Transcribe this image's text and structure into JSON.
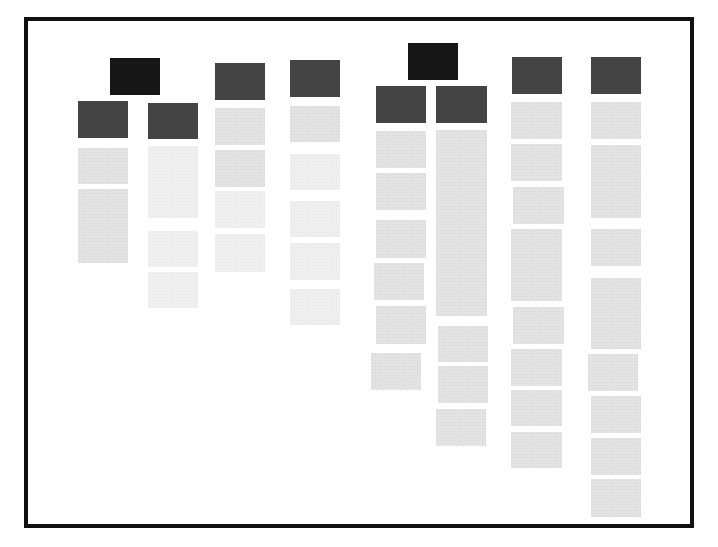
{
  "diagram": {
    "title": "",
    "type": "block-tree-wireframe",
    "colors": {
      "background": "#ffffff",
      "frame_border": "#111111",
      "root": "#1a1a1a",
      "header": "#4d4d4d",
      "item": "#e3e3e3",
      "item_faint": "#efefef"
    },
    "frame": {
      "x": 24,
      "y": 17,
      "w": 670,
      "h": 511,
      "border": 4
    },
    "groups": [
      {
        "id": "group-1",
        "root": {
          "x": 110,
          "y": 58,
          "w": 50,
          "h": 37
        },
        "columns": [
          {
            "id": "column-1",
            "header": {
              "x": 78,
              "y": 101,
              "w": 50,
              "h": 37
            },
            "items": [
              {
                "x": 78,
                "y": 148,
                "w": 50,
                "h": 36
              },
              {
                "x": 78,
                "y": 189,
                "w": 50,
                "h": 74
              }
            ]
          },
          {
            "id": "column-2",
            "header": {
              "x": 148,
              "y": 103,
              "w": 50,
              "h": 36
            },
            "items": [
              {
                "x": 148,
                "y": 146,
                "w": 50,
                "h": 72,
                "faint": true
              },
              {
                "x": 148,
                "y": 231,
                "w": 50,
                "h": 36,
                "faint": true
              },
              {
                "x": 148,
                "y": 272,
                "w": 50,
                "h": 36,
                "faint": true
              }
            ]
          }
        ]
      },
      {
        "id": "group-2",
        "root": null,
        "columns": [
          {
            "id": "column-3",
            "header": {
              "x": 215,
              "y": 63,
              "w": 50,
              "h": 37
            },
            "items": [
              {
                "x": 215,
                "y": 108,
                "w": 50,
                "h": 37
              },
              {
                "x": 215,
                "y": 150,
                "w": 50,
                "h": 37
              },
              {
                "x": 215,
                "y": 191,
                "w": 50,
                "h": 37,
                "faint": true
              },
              {
                "x": 215,
                "y": 234,
                "w": 50,
                "h": 38,
                "faint": true
              }
            ]
          }
        ]
      },
      {
        "id": "group-3",
        "root": null,
        "columns": [
          {
            "id": "column-4",
            "header": {
              "x": 290,
              "y": 60,
              "w": 50,
              "h": 37
            },
            "items": [
              {
                "x": 290,
                "y": 106,
                "w": 50,
                "h": 36
              },
              {
                "x": 290,
                "y": 154,
                "w": 50,
                "h": 36,
                "faint": true
              },
              {
                "x": 290,
                "y": 201,
                "w": 50,
                "h": 36,
                "faint": true
              },
              {
                "x": 290,
                "y": 243,
                "w": 50,
                "h": 37,
                "faint": true
              },
              {
                "x": 290,
                "y": 289,
                "w": 50,
                "h": 36,
                "faint": true
              }
            ]
          }
        ]
      },
      {
        "id": "group-4",
        "root": {
          "x": 408,
          "y": 43,
          "w": 50,
          "h": 37
        },
        "columns": [
          {
            "id": "column-5",
            "header": {
              "x": 376,
              "y": 86,
              "w": 50,
              "h": 37
            },
            "items": [
              {
                "x": 376,
                "y": 131,
                "w": 50,
                "h": 37
              },
              {
                "x": 376,
                "y": 173,
                "w": 50,
                "h": 37
              },
              {
                "x": 376,
                "y": 220,
                "w": 50,
                "h": 38
              },
              {
                "x": 374,
                "y": 263,
                "w": 50,
                "h": 37
              },
              {
                "x": 376,
                "y": 306,
                "w": 50,
                "h": 38
              },
              {
                "x": 371,
                "y": 353,
                "w": 50,
                "h": 37
              }
            ]
          },
          {
            "id": "column-6",
            "header": {
              "x": 436,
              "y": 86,
              "w": 51,
              "h": 37
            },
            "items": [
              {
                "x": 436,
                "y": 130,
                "w": 51,
                "h": 186
              },
              {
                "x": 438,
                "y": 326,
                "w": 50,
                "h": 36
              },
              {
                "x": 438,
                "y": 366,
                "w": 50,
                "h": 37
              },
              {
                "x": 436,
                "y": 409,
                "w": 50,
                "h": 37
              }
            ]
          }
        ]
      },
      {
        "id": "group-5",
        "root": null,
        "columns": [
          {
            "id": "column-7",
            "header": {
              "x": 512,
              "y": 57,
              "w": 50,
              "h": 37
            },
            "items": [
              {
                "x": 511,
                "y": 102,
                "w": 51,
                "h": 37
              },
              {
                "x": 511,
                "y": 144,
                "w": 51,
                "h": 37
              },
              {
                "x": 513,
                "y": 187,
                "w": 51,
                "h": 37
              },
              {
                "x": 511,
                "y": 229,
                "w": 51,
                "h": 72
              },
              {
                "x": 513,
                "y": 307,
                "w": 51,
                "h": 37
              },
              {
                "x": 511,
                "y": 349,
                "w": 51,
                "h": 37
              },
              {
                "x": 511,
                "y": 390,
                "w": 51,
                "h": 36
              },
              {
                "x": 511,
                "y": 432,
                "w": 51,
                "h": 36
              }
            ]
          }
        ]
      },
      {
        "id": "group-6",
        "root": null,
        "columns": [
          {
            "id": "column-8",
            "header": {
              "x": 591,
              "y": 57,
              "w": 50,
              "h": 37
            },
            "items": [
              {
                "x": 591,
                "y": 102,
                "w": 50,
                "h": 37
              },
              {
                "x": 591,
                "y": 145,
                "w": 50,
                "h": 73
              },
              {
                "x": 591,
                "y": 229,
                "w": 50,
                "h": 37
              },
              {
                "x": 591,
                "y": 278,
                "w": 50,
                "h": 71
              },
              {
                "x": 588,
                "y": 354,
                "w": 50,
                "h": 37
              },
              {
                "x": 591,
                "y": 396,
                "w": 50,
                "h": 37
              },
              {
                "x": 591,
                "y": 438,
                "w": 50,
                "h": 37
              },
              {
                "x": 591,
                "y": 479,
                "w": 50,
                "h": 38
              }
            ]
          }
        ]
      }
    ]
  }
}
